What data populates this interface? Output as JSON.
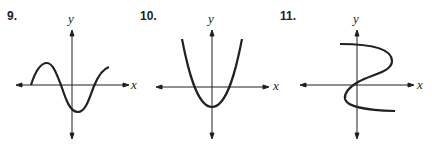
{
  "exercises": [
    {
      "number": "9.",
      "y_label": "y",
      "x_label": "x",
      "curve": "sine-like wave crossing x-axis twice; peak left of y-axis above x-axis, trough right of y-axis below x-axis"
    },
    {
      "number": "10.",
      "y_label": "y",
      "x_label": "x",
      "curve": "upward-opening parabola with vertex on y-axis below x-axis"
    },
    {
      "number": "11.",
      "y_label": "y",
      "x_label": "x",
      "curve": "S-shaped curve that is not a function (fails vertical line test)"
    }
  ]
}
